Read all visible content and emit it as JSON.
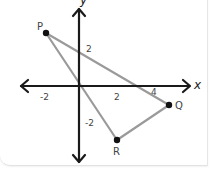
{
  "diagram": {
    "type": "coordinate-plane-triangle",
    "axes": {
      "x_label": "x",
      "y_label": "y",
      "x_ticks": [
        "-2",
        "2",
        "4"
      ],
      "y_ticks": [
        "2",
        "-2"
      ]
    },
    "points": [
      {
        "name": "P",
        "coords": [
          -2,
          3
        ]
      },
      {
        "name": "Q",
        "coords": [
          5,
          -1
        ]
      },
      {
        "name": "R",
        "coords": [
          2,
          -3
        ]
      }
    ],
    "segments": [
      [
        "P",
        "Q"
      ],
      [
        "Q",
        "R"
      ],
      [
        "R",
        "P"
      ]
    ],
    "colors": {
      "axis": "#1a1a1a",
      "triangle": "#999999",
      "point": "#111111",
      "paper": "#ffffff"
    }
  }
}
